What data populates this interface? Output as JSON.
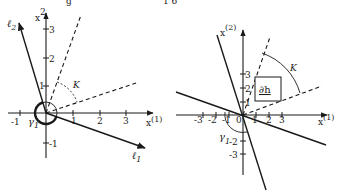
{
  "colors": {
    "ink": "#1a1a1a",
    "background": "#ffffff"
  },
  "top_fragments": {
    "left": "g",
    "right": "1 6"
  },
  "left_diagram": {
    "x_axis_label": "x",
    "x_axis_sup": "(1)",
    "y_axis_label": "x",
    "y_axis_sup": "2",
    "x_ticks": [
      "-1",
      "1",
      "2",
      "3"
    ],
    "y_ticks": [
      "1",
      "2",
      "3",
      "-1"
    ],
    "line_1_label": "ℓ",
    "line_1_sub": "1",
    "line_2_label": "ℓ",
    "line_2_sub": "2",
    "cone_label": "K",
    "curve_label": "γ",
    "curve_sub": "1"
  },
  "right_diagram": {
    "x_axis_label": "x",
    "x_axis_sup": "(1)",
    "y_axis_label": "x",
    "y_axis_sup": "(2)",
    "x_ticks": [
      "-3",
      "-2",
      "-1",
      "0",
      "1",
      "2",
      "3"
    ],
    "y_ticks": [
      "1",
      "2",
      "3",
      "-2",
      "-3"
    ],
    "box_label": "∂h",
    "cone_label": "K",
    "curve_label": "γ",
    "curve_sub": "1"
  }
}
